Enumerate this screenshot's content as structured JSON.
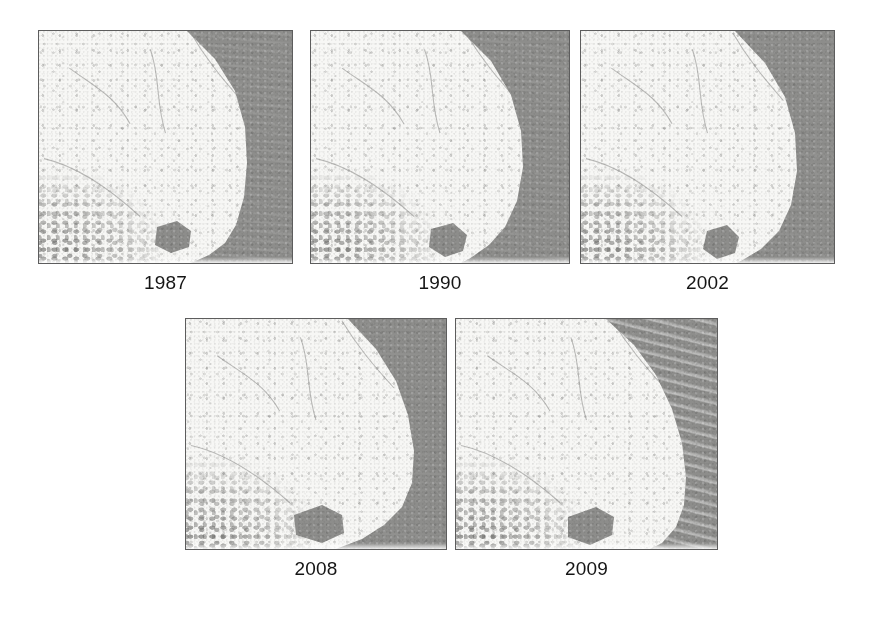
{
  "figure": {
    "title": "",
    "background_color": "#ffffff",
    "panel_border_color": "#5d5d5d",
    "caption_color": "#151515",
    "land_color": "#f7f7f5",
    "water_color": "#8d8d8b",
    "rows": [
      {
        "panel_indices": [
          0,
          1,
          2
        ]
      },
      {
        "panel_indices": [
          3,
          4
        ]
      }
    ]
  },
  "panels": [
    {
      "id": "panel-1987",
      "caption": "1987",
      "image_alt": "satellite-image-1987",
      "x": 38,
      "y": 30,
      "width": 255,
      "height": 234,
      "caption_x": 38,
      "caption_y": 272,
      "caption_width": 255,
      "band_angle": "6deg",
      "band_opacity": 0.55,
      "band_style": "normal",
      "shore_path": "M 148 0 L 176 28 L 196 60 L 206 96 L 208 132 L 205 166 L 197 194 L 186 212 L 170 224 L 152 232 L 142 234 L 255 234 L 255 0 Z",
      "water_patch": "M 118 196 L 138 190 L 152 200 L 150 216 L 132 222 L 116 214 Z"
    },
    {
      "id": "panel-1990",
      "caption": "1990",
      "image_alt": "satellite-image-1990",
      "x": 310,
      "y": 30,
      "width": 260,
      "height": 234,
      "caption_x": 310,
      "caption_y": 272,
      "caption_width": 260,
      "band_angle": "7deg",
      "band_opacity": 0.42,
      "band_style": "normal",
      "shore_path": "M 150 0 L 180 30 L 200 64 L 210 100 L 212 136 L 206 170 L 194 196 L 178 214 L 158 228 L 146 234 L 260 234 L 260 0 Z",
      "water_patch": "M 120 198 L 142 192 L 156 204 L 152 220 L 134 226 L 118 216 Z"
    },
    {
      "id": "panel-2002",
      "caption": "2002",
      "image_alt": "satellite-image-2002",
      "x": 580,
      "y": 30,
      "width": 255,
      "height": 234,
      "caption_x": 580,
      "caption_y": 272,
      "caption_width": 255,
      "band_angle": "5deg",
      "band_opacity": 0.3,
      "band_style": "normal",
      "shore_path": "M 154 0 L 184 32 L 204 66 L 214 102 L 216 140 L 210 174 L 198 200 L 180 218 L 160 230 L 150 234 L 255 234 L 255 0 Z",
      "water_patch": "M 126 200 L 146 194 L 158 206 L 154 222 L 136 228 L 122 218 Z"
    },
    {
      "id": "panel-2008",
      "caption": "2008",
      "image_alt": "satellite-image-2008",
      "x": 185,
      "y": 318,
      "width": 262,
      "height": 232,
      "caption_x": 185,
      "caption_y": 558,
      "caption_width": 262,
      "band_angle": "4deg",
      "band_opacity": 0.22,
      "band_style": "normal",
      "shore_path": "M 162 0 L 190 30 L 210 62 L 222 96 L 228 132 L 226 164 L 216 188 L 198 206 L 176 220 L 150 230 L 140 232 L 262 232 L 262 0 Z",
      "water_patch": "M 108 196 L 136 186 L 156 196 L 158 214 L 136 224 L 110 216 Z"
    },
    {
      "id": "panel-2009",
      "caption": "2009",
      "image_alt": "satellite-image-2009",
      "x": 455,
      "y": 318,
      "width": 263,
      "height": 232,
      "caption_x": 455,
      "caption_y": 558,
      "caption_width": 263,
      "band_angle": "14deg",
      "band_opacity": 1.0,
      "band_style": "strong",
      "shore_path": "M 150 0 L 178 26 L 200 56 L 216 90 L 226 124 L 230 158 L 228 186 L 220 208 L 206 224 L 190 232 L 263 232 L 263 0 Z",
      "water_patch": "M 112 198 L 140 188 L 158 198 L 156 216 L 134 226 L 112 218 Z"
    }
  ]
}
